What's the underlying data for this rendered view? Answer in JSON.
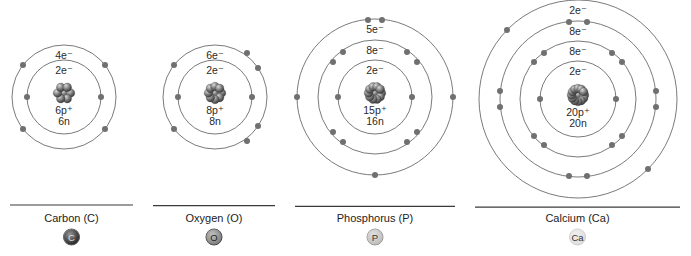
{
  "atoms": [
    {
      "name": "Carbon (C)",
      "symbol": "C",
      "center": [
        64,
        97
      ],
      "shells": [
        {
          "radius": 37,
          "label": "2e⁻",
          "electrons": [
            [
              -37,
              0
            ],
            [
              37,
              0
            ]
          ]
        },
        {
          "radius": 52,
          "label": "4e⁻",
          "electrons": [
            [
              -41,
              -32
            ],
            [
              41,
              -32
            ],
            [
              -41,
              32
            ],
            [
              41,
              32
            ]
          ]
        }
      ],
      "nucleus": {
        "protons": "6p⁺",
        "neutrons": "6n"
      },
      "separator": [
        10,
        133
      ],
      "badge": {
        "fill": "#1a1a1a",
        "stroke": "#555555",
        "text_color": "#dddddd"
      }
    },
    {
      "name": "Oxygen (O)",
      "symbol": "O",
      "center": [
        215,
        97
      ],
      "shells": [
        {
          "radius": 37,
          "label": "2e⁻",
          "electrons": [
            [
              -37,
              0
            ],
            [
              37,
              0
            ]
          ]
        },
        {
          "radius": 52,
          "label": "6e⁻",
          "electrons": [
            [
              -41,
              -32
            ],
            [
              32,
              -44
            ],
            [
              43,
              -29
            ],
            [
              -41,
              32
            ],
            [
              32,
              44
            ],
            [
              43,
              29
            ]
          ]
        }
      ],
      "nucleus": {
        "protons": "8p⁺",
        "neutrons": "8n"
      },
      "separator": [
        153,
        275
      ],
      "badge": {
        "fill": "#777777",
        "stroke": "#444444",
        "text_color": "#222222"
      }
    },
    {
      "name": "Phosphorus (P)",
      "symbol": "P",
      "center": [
        375,
        97
      ],
      "shells": [
        {
          "radius": 37,
          "label": "2e⁻",
          "electrons": [
            [
              -37,
              0
            ],
            [
              37,
              0
            ]
          ]
        },
        {
          "radius": 57,
          "label": "8e⁻",
          "electrons": [
            [
              -32,
              -45
            ],
            [
              32,
              -45
            ],
            [
              -42,
              -35
            ],
            [
              42,
              -35
            ],
            [
              -32,
              45
            ],
            [
              32,
              45
            ],
            [
              -42,
              35
            ],
            [
              42,
              35
            ]
          ]
        },
        {
          "radius": 78,
          "label": "5e⁻",
          "electrons": [
            [
              -7,
              -77
            ],
            [
              7,
              -77
            ],
            [
              -78,
              0
            ],
            [
              78,
              0
            ],
            [
              0,
              78
            ]
          ]
        }
      ],
      "nucleus": {
        "protons": "15p⁺",
        "neutrons": "16n"
      },
      "separator": [
        295,
        455
      ],
      "badge": {
        "fill": "#bbbbbb",
        "stroke": "#999999",
        "text_color": "#333333"
      }
    },
    {
      "name": "Calcium (Ca)",
      "symbol": "Ca",
      "center": [
        578,
        99
      ],
      "shells": [
        {
          "radius": 38,
          "label": "2e⁻",
          "electrons": [
            [
              -38,
              0
            ],
            [
              38,
              0
            ]
          ]
        },
        {
          "radius": 58,
          "label": "8e⁻",
          "electrons": [
            [
              -34,
              -46
            ],
            [
              34,
              -46
            ],
            [
              -44,
              -37
            ],
            [
              44,
              -37
            ],
            [
              -34,
              46
            ],
            [
              34,
              46
            ],
            [
              -44,
              37
            ],
            [
              44,
              37
            ]
          ]
        },
        {
          "radius": 78,
          "label": "8e⁻",
          "electrons": [
            [
              -9,
              -77
            ],
            [
              9,
              -77
            ],
            [
              -78,
              -8
            ],
            [
              -78,
              8
            ],
            [
              78,
              -8
            ],
            [
              78,
              8
            ],
            [
              -9,
              77
            ],
            [
              9,
              77
            ]
          ]
        },
        {
          "radius": 99,
          "label": "2e⁻",
          "electrons": [
            [
              -71,
              -69
            ],
            [
              70,
              70
            ]
          ]
        }
      ],
      "nucleus": {
        "protons": "20p⁺",
        "neutrons": "20n"
      },
      "separator": [
        475,
        680
      ],
      "badge": {
        "fill": "#dddddd",
        "stroke": "#cccccc",
        "text_color": "#333333"
      }
    }
  ]
}
